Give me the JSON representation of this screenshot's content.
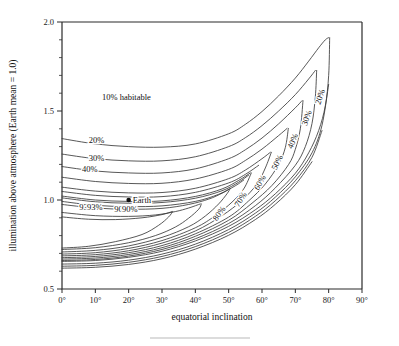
{
  "chart_data": {
    "type": "line",
    "title": "",
    "xlabel": "equatorial inclination",
    "ylabel": "illumination above atmosphere (Earth mean = 1.0)",
    "xlim": [
      0,
      90
    ],
    "ylim": [
      0.5,
      2.0
    ],
    "xticks": [
      "0°",
      "10°",
      "20°",
      "30°",
      "40°",
      "50°",
      "60°",
      "70°",
      "80°",
      "90°"
    ],
    "xtick_values": [
      0,
      10,
      20,
      30,
      40,
      50,
      60,
      70,
      80,
      90
    ],
    "yticks": [
      "0.5",
      "1.0",
      "1.5",
      "2.0"
    ],
    "ytick_values": [
      0.5,
      1.0,
      1.5,
      2.0
    ],
    "ytick_minor": [
      0.6,
      0.7,
      0.8,
      0.9,
      1.1,
      1.2,
      1.3,
      1.4,
      1.6,
      1.7,
      1.8,
      1.9
    ],
    "grid": false,
    "legend": "inline-contour-labels",
    "annotations": [
      {
        "text": "10% habitable",
        "x": 12,
        "y": 1.56
      },
      {
        "text": "20%",
        "x": 8,
        "y": 1.32
      },
      {
        "text": "30%",
        "x": 8,
        "y": 1.22
      },
      {
        "text": "40%",
        "x": 6,
        "y": 1.155
      },
      {
        "text": "93%",
        "x": 7.5,
        "y": 0.945
      },
      {
        "text": "90%",
        "x": 18,
        "y": 0.93
      },
      {
        "text": "Earth",
        "x": 20,
        "y": 1.0
      }
    ],
    "earth_marker": {
      "label": "Earth",
      "x": 20,
      "y": 1.0
    },
    "series": [
      {
        "name": "20%",
        "label": "20%",
        "label_angle": -72,
        "upper": [
          [
            0,
            1.345
          ],
          [
            10,
            1.315
          ],
          [
            20,
            1.3
          ],
          [
            30,
            1.297
          ],
          [
            40,
            1.315
          ],
          [
            50,
            1.372
          ],
          [
            55,
            1.425
          ],
          [
            60,
            1.497
          ],
          [
            65,
            1.585
          ],
          [
            70,
            1.685
          ],
          [
            74,
            1.78
          ],
          [
            77,
            1.855
          ],
          [
            79,
            1.9
          ],
          [
            80,
            1.912
          ]
        ],
        "lower": [
          [
            0,
            0.655
          ],
          [
            10,
            0.66
          ],
          [
            20,
            0.678
          ],
          [
            30,
            0.712
          ],
          [
            40,
            0.77
          ],
          [
            50,
            0.852
          ],
          [
            58,
            0.945
          ],
          [
            64,
            1.035
          ],
          [
            70,
            1.15
          ],
          [
            74,
            1.265
          ],
          [
            77,
            1.39
          ],
          [
            79,
            1.53
          ],
          [
            80,
            1.7
          ],
          [
            80.3,
            1.912
          ]
        ],
        "label_pos": [
          78.2,
          1.575
        ]
      },
      {
        "name": "30%",
        "label": "30%",
        "label_angle": -70,
        "upper": [
          [
            0,
            1.258
          ],
          [
            10,
            1.232
          ],
          [
            20,
            1.22
          ],
          [
            30,
            1.22
          ],
          [
            40,
            1.243
          ],
          [
            50,
            1.3
          ],
          [
            55,
            1.35
          ],
          [
            60,
            1.418
          ],
          [
            65,
            1.5
          ],
          [
            70,
            1.592
          ],
          [
            74,
            1.68
          ],
          [
            76,
            1.728
          ]
        ],
        "lower": [
          [
            0,
            0.66
          ],
          [
            10,
            0.666
          ],
          [
            20,
            0.685
          ],
          [
            30,
            0.722
          ],
          [
            40,
            0.782
          ],
          [
            50,
            0.868
          ],
          [
            58,
            0.968
          ],
          [
            64,
            1.068
          ],
          [
            70,
            1.195
          ],
          [
            73,
            1.3
          ],
          [
            75,
            1.43
          ],
          [
            76,
            1.58
          ],
          [
            76.4,
            1.728
          ]
        ],
        "label_pos": [
          74.2,
          1.455
        ]
      },
      {
        "name": "40%",
        "label": "40%",
        "label_angle": -67,
        "upper": [
          [
            0,
            1.188
          ],
          [
            10,
            1.163
          ],
          [
            20,
            1.152
          ],
          [
            30,
            1.152
          ],
          [
            40,
            1.175
          ],
          [
            50,
            1.232
          ],
          [
            55,
            1.282
          ],
          [
            60,
            1.348
          ],
          [
            65,
            1.428
          ],
          [
            70,
            1.518
          ],
          [
            72,
            1.558
          ]
        ],
        "lower": [
          [
            0,
            0.668
          ],
          [
            10,
            0.674
          ],
          [
            20,
            0.694
          ],
          [
            30,
            0.732
          ],
          [
            40,
            0.796
          ],
          [
            50,
            0.886
          ],
          [
            57,
            0.982
          ],
          [
            63,
            1.082
          ],
          [
            68,
            1.2
          ],
          [
            70,
            1.285
          ],
          [
            71.5,
            1.4
          ],
          [
            72.3,
            1.558
          ]
        ],
        "label_pos": [
          70.0,
          1.325
        ]
      },
      {
        "name": "50%",
        "label": "50%",
        "label_angle": -64,
        "upper": [
          [
            0,
            1.128
          ],
          [
            10,
            1.104
          ],
          [
            20,
            1.093
          ],
          [
            30,
            1.094
          ],
          [
            40,
            1.118
          ],
          [
            50,
            1.172
          ],
          [
            55,
            1.222
          ],
          [
            60,
            1.286
          ],
          [
            65,
            1.362
          ],
          [
            67.5,
            1.402
          ]
        ],
        "lower": [
          [
            0,
            0.676
          ],
          [
            10,
            0.683
          ],
          [
            20,
            0.704
          ],
          [
            30,
            0.744
          ],
          [
            40,
            0.81
          ],
          [
            50,
            0.904
          ],
          [
            56,
            0.995
          ],
          [
            61,
            1.09
          ],
          [
            65,
            1.2
          ],
          [
            67,
            1.295
          ],
          [
            67.9,
            1.402
          ]
        ],
        "label_pos": [
          65.3,
          1.205
        ]
      },
      {
        "name": "60%",
        "label": "60%",
        "label_angle": -60,
        "upper": [
          [
            0,
            1.072
          ],
          [
            10,
            1.05
          ],
          [
            20,
            1.04
          ],
          [
            30,
            1.042
          ],
          [
            40,
            1.066
          ],
          [
            50,
            1.12
          ],
          [
            55,
            1.168
          ],
          [
            60,
            1.232
          ],
          [
            62.5,
            1.268
          ]
        ],
        "lower": [
          [
            0,
            0.686
          ],
          [
            10,
            0.693
          ],
          [
            20,
            0.715
          ],
          [
            30,
            0.758
          ],
          [
            40,
            0.826
          ],
          [
            48,
            0.912
          ],
          [
            54,
            0.998
          ],
          [
            58.5,
            1.09
          ],
          [
            61,
            1.18
          ],
          [
            62.8,
            1.268
          ]
        ],
        "label_pos": [
          60.1,
          1.09
        ]
      },
      {
        "name": "70%",
        "label": "70%",
        "label_angle": -57,
        "upper": [
          [
            0,
            1.022
          ],
          [
            10,
            1.0
          ],
          [
            20,
            0.992
          ],
          [
            30,
            0.995
          ],
          [
            40,
            1.02
          ],
          [
            48,
            1.062
          ],
          [
            53,
            1.11
          ],
          [
            56.5,
            1.152
          ]
        ],
        "lower": [
          [
            0,
            0.696
          ],
          [
            10,
            0.704
          ],
          [
            20,
            0.728
          ],
          [
            30,
            0.772
          ],
          [
            40,
            0.844
          ],
          [
            46,
            0.912
          ],
          [
            51,
            0.988
          ],
          [
            54.5,
            1.062
          ],
          [
            56.8,
            1.152
          ]
        ],
        "label_pos": [
          54.3,
          0.995
        ]
      },
      {
        "name": "80%",
        "label": "80%",
        "label_angle": -54,
        "upper": [
          [
            0,
            0.975
          ],
          [
            10,
            0.955
          ],
          [
            20,
            0.948
          ],
          [
            30,
            0.953
          ],
          [
            38,
            0.975
          ],
          [
            44,
            1.005
          ],
          [
            48,
            1.038
          ],
          [
            50.2,
            1.062
          ]
        ],
        "lower": [
          [
            0,
            0.708
          ],
          [
            10,
            0.717
          ],
          [
            20,
            0.742
          ],
          [
            30,
            0.79
          ],
          [
            38,
            0.85
          ],
          [
            43,
            0.91
          ],
          [
            47,
            0.978
          ],
          [
            49.5,
            1.035
          ],
          [
            50.4,
            1.062
          ]
        ],
        "label_pos": [
          47.8,
          0.915
        ]
      },
      {
        "name": "90%",
        "label": "90%",
        "label_angle": 0,
        "upper": [
          [
            0,
            0.93
          ],
          [
            10,
            0.912
          ],
          [
            20,
            0.908
          ],
          [
            28,
            0.916
          ],
          [
            34,
            0.935
          ],
          [
            38,
            0.955
          ],
          [
            41.5,
            0.978
          ]
        ],
        "lower": [
          [
            0,
            0.722
          ],
          [
            10,
            0.732
          ],
          [
            20,
            0.76
          ],
          [
            28,
            0.8
          ],
          [
            34,
            0.848
          ],
          [
            38,
            0.898
          ],
          [
            41,
            0.948
          ],
          [
            41.8,
            0.978
          ]
        ],
        "label_pos": [
          18,
          0.93
        ]
      },
      {
        "name": "93%",
        "label": "93%",
        "label_angle": 0,
        "upper": [
          [
            0,
            0.905
          ],
          [
            8,
            0.892
          ],
          [
            16,
            0.89
          ],
          [
            24,
            0.9
          ],
          [
            30,
            0.918
          ],
          [
            33,
            0.935
          ]
        ],
        "lower": [
          [
            0,
            0.73
          ],
          [
            8,
            0.74
          ],
          [
            16,
            0.766
          ],
          [
            24,
            0.806
          ],
          [
            29,
            0.858
          ],
          [
            32,
            0.905
          ],
          [
            33.2,
            0.935
          ]
        ],
        "label_pos": [
          7.5,
          0.945
        ]
      }
    ],
    "extra_upper_band": [
      {
        "name": "band-a",
        "upper": [
          [
            0,
            1.012
          ],
          [
            10,
            0.99
          ],
          [
            20,
            0.982
          ],
          [
            30,
            0.986
          ],
          [
            40,
            1.01
          ],
          [
            48,
            1.052
          ],
          [
            53,
            1.1
          ],
          [
            56,
            1.14
          ]
        ]
      },
      {
        "name": "band-b",
        "upper": [
          [
            0,
            1.048
          ],
          [
            10,
            1.026
          ],
          [
            20,
            1.017
          ],
          [
            30,
            1.019
          ],
          [
            40,
            1.043
          ],
          [
            50,
            1.096
          ],
          [
            55,
            1.144
          ],
          [
            59,
            1.195
          ]
        ]
      },
      {
        "name": "band-c",
        "upper": [
          [
            0,
            0.992
          ],
          [
            10,
            0.97
          ],
          [
            20,
            0.963
          ],
          [
            30,
            0.967
          ],
          [
            40,
            0.992
          ],
          [
            47,
            1.032
          ],
          [
            52,
            1.08
          ],
          [
            54.5,
            1.112
          ]
        ]
      }
    ],
    "extra_lower_band": [
      {
        "name": "lband-a",
        "lower": [
          [
            0,
            0.64
          ],
          [
            10,
            0.645
          ],
          [
            20,
            0.662
          ],
          [
            30,
            0.696
          ],
          [
            40,
            0.752
          ],
          [
            50,
            0.834
          ],
          [
            58,
            0.926
          ],
          [
            64,
            1.016
          ],
          [
            70,
            1.13
          ],
          [
            75,
            1.265
          ],
          [
            78,
            1.42
          ],
          [
            80,
            1.65
          ]
        ]
      },
      {
        "name": "lband-b",
        "lower": [
          [
            0,
            0.628
          ],
          [
            10,
            0.633
          ],
          [
            20,
            0.65
          ],
          [
            30,
            0.683
          ],
          [
            40,
            0.738
          ],
          [
            50,
            0.818
          ],
          [
            58,
            0.908
          ],
          [
            64,
            0.996
          ],
          [
            70,
            1.108
          ],
          [
            75,
            1.24
          ],
          [
            78,
            1.39
          ]
        ]
      },
      {
        "name": "lband-c",
        "lower": [
          [
            0,
            0.617
          ],
          [
            10,
            0.622
          ],
          [
            20,
            0.638
          ],
          [
            30,
            0.67
          ],
          [
            40,
            0.724
          ],
          [
            50,
            0.802
          ],
          [
            58,
            0.89
          ],
          [
            64,
            0.976
          ],
          [
            70,
            1.086
          ],
          [
            75,
            1.215
          ]
        ]
      }
    ]
  },
  "footer": {
    "rule": ""
  }
}
